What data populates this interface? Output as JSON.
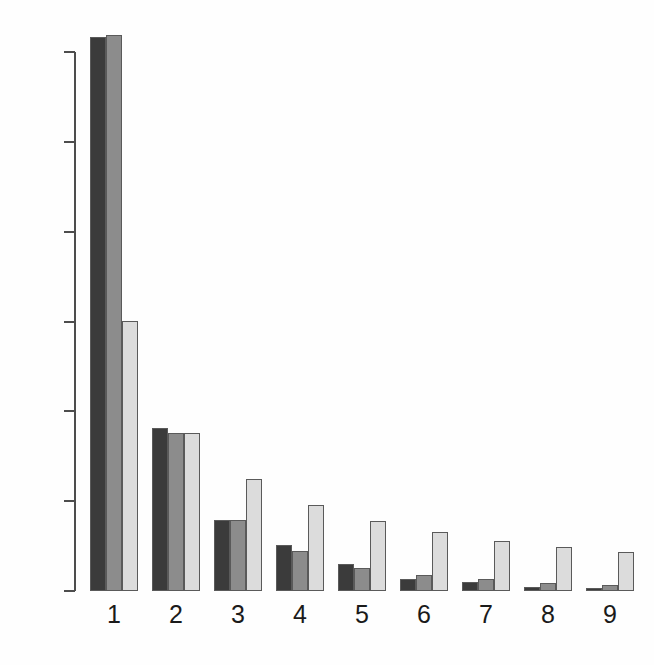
{
  "chart_data": {
    "type": "bar",
    "title": "",
    "subtitle": "",
    "xlabel": "",
    "ylabel": "",
    "grid": false,
    "legend": "none",
    "categories": [
      "1",
      "2",
      "3",
      "4",
      "5",
      "6",
      "7",
      "8",
      "9"
    ],
    "ylim": [
      0.0,
      0.62
    ],
    "yticks": [
      "0.0",
      "0.1",
      "0.2",
      "0.3",
      "0.4",
      "0.5",
      "0.6"
    ],
    "ytick_values": [
      0.0,
      0.1,
      0.2,
      0.3,
      0.4,
      0.5,
      0.6
    ],
    "xtick_labels": [
      "1",
      "2",
      "3",
      "4",
      "5",
      "6",
      "7",
      "8",
      "9"
    ],
    "series": [
      {
        "name": "series-1",
        "color": "#3b3b3b",
        "values": [
          0.617,
          0.181,
          0.079,
          0.051,
          0.03,
          0.013,
          0.01,
          0.005,
          0.003
        ]
      },
      {
        "name": "series-2",
        "color": "#8c8c8c",
        "values": [
          0.619,
          0.176,
          0.079,
          0.044,
          0.026,
          0.018,
          0.013,
          0.009,
          0.007
        ]
      },
      {
        "name": "series-3",
        "color": "#dcdcdc",
        "values": [
          0.301,
          0.176,
          0.125,
          0.096,
          0.078,
          0.066,
          0.056,
          0.049,
          0.043
        ]
      }
    ]
  },
  "axis": {
    "line_color": "#4d4d4d",
    "tick_label_color": "#1a1a1a"
  }
}
